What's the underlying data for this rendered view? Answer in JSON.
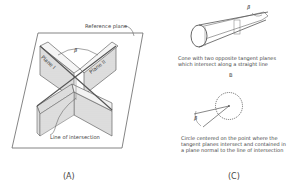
{
  "panel_a": {
    "label": "(A)",
    "reference_plane_label": "Reference plane",
    "plane_1_label": "Plane I",
    "plane_2_label": "Plane II",
    "angle_symbol": "β",
    "intersection_label": "Line of intersection"
  },
  "panel_c": {
    "label": "(C)",
    "cone_caption": "Cone with two opposite tangent planes which intersect along a straight line",
    "cone_angle_symbol": "β",
    "sub_label_b": "B",
    "circle_angle_symbol": "β",
    "circle_caption": "Circle centered on the point where the tangent planes intersect and contained in a plane normal to the line of intersection"
  },
  "colors": {
    "line": "#555555",
    "shade": "#c8c8c8",
    "text": "#444444"
  }
}
